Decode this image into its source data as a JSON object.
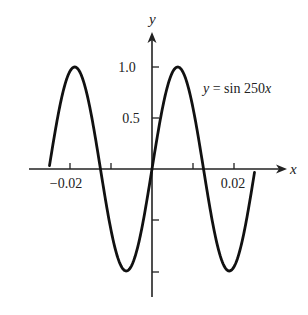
{
  "chart_data": {
    "type": "line",
    "title": "",
    "function": "y = sin 250x",
    "annotation": "y = sin 250x",
    "xlabel": "x",
    "ylabel": "y",
    "xlim": [
      -0.025,
      0.025
    ],
    "ylim": [
      -1.0,
      1.0
    ],
    "x_ticks": [
      -0.02,
      -0.01,
      0.01,
      0.02
    ],
    "x_tick_labels": [
      "−0.02",
      "",
      "",
      "0.02"
    ],
    "y_ticks": [
      1.0,
      0.5,
      -0.5,
      -1.0
    ],
    "y_tick_labels": [
      "1.0",
      "0.5",
      "",
      ""
    ],
    "grid": false,
    "legend": "none",
    "series": [
      {
        "name": "y = sin 250x",
        "x": [
          -0.025,
          -0.0189,
          -0.0126,
          -0.0063,
          0.0,
          0.0063,
          0.0126,
          0.0189,
          0.025
        ],
        "y": [
          0.03,
          1.0,
          0.0,
          -1.0,
          0.0,
          1.0,
          0.0,
          -1.0,
          -0.03
        ]
      }
    ],
    "color": "#111111"
  },
  "labels": {
    "x_axis": "x",
    "y_axis": "y",
    "curve": "y = sin 250x",
    "tick_x_neg": "−0.02",
    "tick_x_pos": "0.02",
    "tick_y_1": "1.0",
    "tick_y_half": "0.5"
  }
}
